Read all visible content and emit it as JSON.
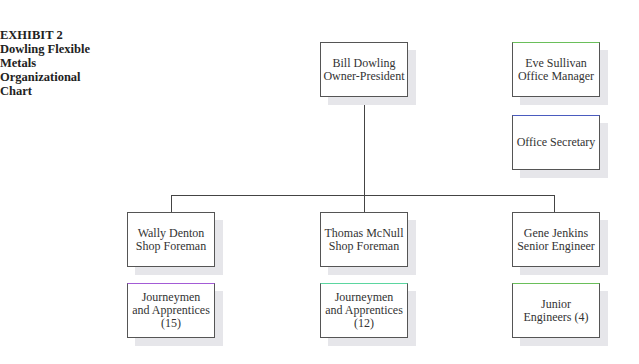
{
  "exhibit": {
    "label": "EXHIBIT 2",
    "title_lines": [
      "Dowling Flexible",
      "Metals",
      "Organizational",
      "Chart"
    ]
  },
  "nodes": {
    "owner": {
      "lines": [
        "Bill Dowling",
        "Owner-President"
      ],
      "top_border": "#555555"
    },
    "office_manager": {
      "lines": [
        "Eve Sullivan",
        "Office Manager"
      ],
      "top_border": "#6abf5a"
    },
    "office_secretary": {
      "lines": [
        "Office Secretary"
      ],
      "top_border": "#4a5bbf"
    },
    "foreman1": {
      "lines": [
        "Wally Denton",
        "Shop Foreman"
      ],
      "top_border": "#555555"
    },
    "foreman2": {
      "lines": [
        "Thomas McNull",
        "Shop Foreman"
      ],
      "top_border": "#555555"
    },
    "senior_engineer": {
      "lines": [
        "Gene Jenkins",
        "Senior Engineer"
      ],
      "top_border": "#555555"
    },
    "journeymen1": {
      "lines": [
        "Journeymen",
        "and Apprentices",
        "(15)"
      ],
      "top_border": "#a35bd6"
    },
    "journeymen2": {
      "lines": [
        "Journeymen",
        "and Apprentices",
        "(12)"
      ],
      "top_border": "#5bd6a0"
    },
    "junior_engineers": {
      "lines": [
        "Junior",
        "Engineers (4)"
      ],
      "top_border": "#6abf5a"
    }
  }
}
